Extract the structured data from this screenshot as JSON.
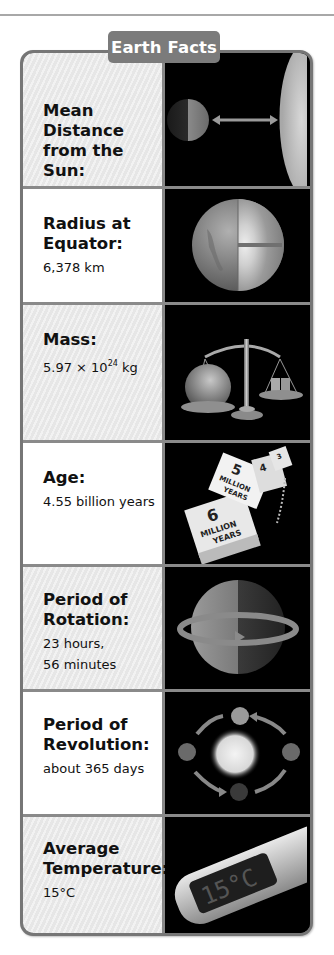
{
  "title": "Earth Facts",
  "facts": [
    {
      "label": "Mean Distance from the Sun:",
      "label_lines": [
        "Mean Distance",
        "from the Sun:"
      ],
      "value_lines": [
        "149.6 million km"
      ],
      "image": "earth-sun-distance-illustration"
    },
    {
      "label": "Radius at Equator:",
      "label_lines": [
        "Radius at",
        "Equator:"
      ],
      "value_lines": [
        "6,378 km"
      ],
      "image": "earth-cross-section-illustration"
    },
    {
      "label": "Mass:",
      "label_lines": [
        "Mass:"
      ],
      "value_base": "5.97 × 10",
      "value_exp": "24",
      "value_unit": " kg",
      "image": "balance-scale-illustration"
    },
    {
      "label": "Age:",
      "label_lines": [
        "Age:"
      ],
      "value_lines": [
        "4.55 billion years"
      ],
      "image": "calendar-pages-illustration",
      "calendar_pages": [
        {
          "num": "6",
          "text": "MILLION YEARS"
        },
        {
          "num": "5",
          "text": "MILLION YEARS"
        },
        {
          "num": "4",
          "text": "MILLION YEARS"
        },
        {
          "num": "3",
          "text": "MILLION YEARS"
        }
      ]
    },
    {
      "label": "Period of Rotation:",
      "label_lines": [
        "Period of",
        "Rotation:"
      ],
      "value_lines": [
        "23 hours,",
        "56 minutes"
      ],
      "image": "rotating-earth-illustration"
    },
    {
      "label": "Period of Revolution:",
      "label_lines": [
        "Period of",
        "Revolution:"
      ],
      "value_lines": [
        "about 365 days"
      ],
      "image": "orbit-illustration"
    },
    {
      "label": "Average Temperature:",
      "label_lines": [
        "Average",
        "Temperature:"
      ],
      "value_lines": [
        "15°C"
      ],
      "image": "thermometer-illustration",
      "thermometer_display": "15°C"
    }
  ],
  "colors": {
    "frame": "#767676",
    "tab": "#7b7b7b",
    "shaded_cell": "#ebebeb",
    "image_bg": "#000000"
  }
}
